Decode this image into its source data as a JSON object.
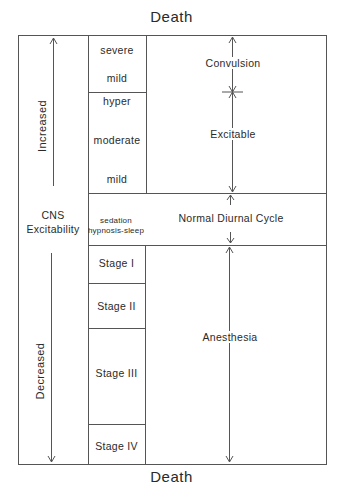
{
  "diagram": {
    "top_label": "Death",
    "bottom_label": "Death",
    "axis": {
      "center_label_line1": "CNS",
      "center_label_line2": "Excitability",
      "increased_label": "Increased",
      "decreased_label": "Decreased"
    },
    "levels": {
      "convulsion": {
        "severe": "severe",
        "mild": "mild",
        "state": "Convulsion"
      },
      "excitable": {
        "hyper": "hyper",
        "moderate": "moderate",
        "mild": "mild",
        "state": "Excitable"
      },
      "normal": {
        "line1": "sedation",
        "line2": "hypnosis-sleep",
        "state": "Normal Diurnal Cycle"
      },
      "anesthesia": {
        "stage1": "Stage I",
        "stage2": "Stage II",
        "stage3": "Stage III",
        "stage4": "Stage IV",
        "state": "Anesthesia"
      }
    },
    "colors": {
      "line": "#555555",
      "text": "#2a2a2a",
      "background": "#ffffff"
    }
  }
}
